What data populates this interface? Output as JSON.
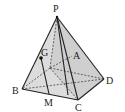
{
  "diagram": {
    "type": "pyramid",
    "labels": {
      "P": "P",
      "A": "A",
      "B": "B",
      "C": "C",
      "D": "D",
      "G": "G",
      "M": "M"
    },
    "colors": {
      "stroke": "#222222",
      "face_light": "#e6e6e6",
      "face_mid": "#d4d4d4",
      "face_dark": "#c4c4c4",
      "background": "#ffffff"
    }
  }
}
